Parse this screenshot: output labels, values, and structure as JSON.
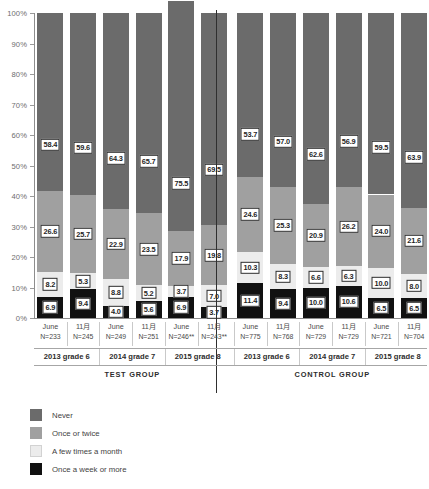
{
  "chart_data": {
    "type": "bar",
    "subtype": "stacked-percentage-column",
    "title": "",
    "xlabel": "",
    "ylabel": "",
    "ylim": [
      0,
      100
    ],
    "ytick_labels": [
      "100%",
      "90%",
      "80%",
      "70%",
      "60%",
      "50%",
      "40%",
      "30%",
      "20%",
      "10%",
      "0%"
    ],
    "ytick_values": [
      100,
      90,
      80,
      70,
      60,
      50,
      40,
      30,
      20,
      10,
      0
    ],
    "grid": false,
    "legend_position": "bottom-left",
    "legend": [
      {
        "label": "Never",
        "color": "#6b6b6b",
        "key": "never"
      },
      {
        "label": "Once or twice",
        "color": "#a0a0a0",
        "key": "once_or_twice"
      },
      {
        "label": "A few times a month",
        "color": "#ececec",
        "key": "few_times_a_month"
      },
      {
        "label": "Once a week or more",
        "color": "#111111",
        "key": "once_a_week_or_more"
      }
    ],
    "series": [
      {
        "name": "Once a week or more",
        "color": "#111111",
        "values": [
          6.9,
          9.4,
          4.0,
          5.6,
          6.9,
          3.7,
          11.4,
          9.4,
          10.0,
          10.6,
          6.5,
          6.5
        ]
      },
      {
        "name": "A few times a month",
        "color": "#ececec",
        "values": [
          8.2,
          5.3,
          8.8,
          5.2,
          3.7,
          7.0,
          10.3,
          8.3,
          6.6,
          6.3,
          10.0,
          8.0
        ]
      },
      {
        "name": "Once or twice",
        "color": "#a0a0a0",
        "values": [
          26.6,
          25.7,
          22.9,
          23.5,
          17.9,
          19.8,
          24.6,
          25.3,
          20.9,
          26.2,
          24.0,
          21.6
        ]
      },
      {
        "name": "Never",
        "color": "#6b6b6b",
        "values": [
          58.4,
          59.6,
          64.3,
          65.7,
          75.5,
          69.5,
          53.7,
          57.0,
          62.6,
          56.9,
          59.5,
          63.9
        ]
      }
    ],
    "categories": [
      {
        "month": "June",
        "n": "N=233",
        "group": "2013 grade 6",
        "set": "TEST GROUP"
      },
      {
        "month": "11月",
        "n": "N=245",
        "group": "2013 grade 6",
        "set": "TEST GROUP"
      },
      {
        "month": "June",
        "n": "N=249",
        "group": "2014 grade 7",
        "set": "TEST GROUP"
      },
      {
        "month": "11月",
        "n": "N=251",
        "group": "2014 grade 7",
        "set": "TEST GROUP"
      },
      {
        "month": "June",
        "n": "N=246**",
        "group": "2015 grade 8",
        "set": "TEST GROUP"
      },
      {
        "month": "11月",
        "n": "N=243**",
        "group": "2015 grade 8",
        "set": "TEST GROUP"
      },
      {
        "month": "June",
        "n": "N=775",
        "group": "2013 grade 6",
        "set": "CONTROL GROUP"
      },
      {
        "month": "11月",
        "n": "N=768",
        "group": "2013 grade 6",
        "set": "CONTROL GROUP"
      },
      {
        "month": "June",
        "n": "N=729",
        "group": "2014 grade 7",
        "set": "CONTROL GROUP"
      },
      {
        "month": "11月",
        "n": "N=729",
        "group": "2014 grade 7",
        "set": "CONTROL GROUP"
      },
      {
        "month": "June",
        "n": "N=721",
        "group": "2015 grade 8",
        "set": "CONTROL GROUP"
      },
      {
        "month": "11月",
        "n": "N=704",
        "group": "2015 grade 8",
        "set": "CONTROL GROUP"
      }
    ],
    "group_headers": [
      {
        "label": "2013 grade 6"
      },
      {
        "label": "2014 grade 7"
      },
      {
        "label": "2015 grade 8"
      },
      {
        "label": "2013 grade 6"
      },
      {
        "label": "2014 grade 7"
      },
      {
        "label": "2015 grade 8"
      }
    ],
    "set_headers": [
      {
        "label": "TEST GROUP"
      },
      {
        "label": "CONTROL GROUP"
      }
    ]
  }
}
